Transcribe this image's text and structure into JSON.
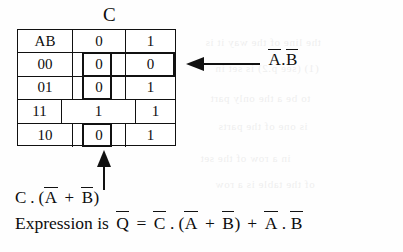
{
  "figure": {
    "type": "karnaugh-map-truth-table",
    "column_variable_label": "C",
    "row_variable_label": "AB"
  },
  "table": {
    "corner_header": "AB",
    "col_headers": [
      "0",
      "1"
    ],
    "rows": [
      {
        "ab": "00",
        "c0": "0",
        "c1": "0",
        "merged": false
      },
      {
        "ab": "01",
        "c0": "0",
        "c1": "1",
        "merged": false
      },
      {
        "ab": "11",
        "c0": "1",
        "c1": "1",
        "merged": true,
        "merged_value": "1"
      },
      {
        "ab": "10",
        "c0": "0",
        "c1": "1",
        "merged": false
      }
    ]
  },
  "groups": [
    {
      "name": "group-a-bar-b-bar",
      "label": "A.B (both complemented) row 00 across C=0 and C=1"
    },
    {
      "name": "group-c-bar-term",
      "label": "C=0 column cells for rows 00 and 01"
    },
    {
      "name": "group-c0-row10",
      "label": "C=0 cell for row 10"
    }
  ],
  "annotations": {
    "right_label": {
      "a_bar": "A",
      "dot": ".",
      "b_bar": "B",
      "plain": "A.B"
    },
    "bottom_label": {
      "c": "C",
      "dot": ".",
      "open": "(",
      "a_bar": "A",
      "plus": "+",
      "b_bar": "B",
      "close": ")",
      "plain": "C . (A + B)"
    }
  },
  "expression": {
    "prefix": "Expression is",
    "q_bar": "Q",
    "equals": "=",
    "c_bar": "C",
    "dot1": ".",
    "open": "(",
    "a_bar1": "A",
    "plus1": "+",
    "b_bar1": "B",
    "close": ")",
    "plus2": "+",
    "a_bar2": "A",
    "dot2": ".",
    "b_bar2": "B",
    "plain": "Expression is Q = C . (A + B) + A . B"
  },
  "colors": {
    "ink": "#111111",
    "paper": "#fefefe"
  },
  "ghost_text": [
    "the line of the way it is",
    "(1) (see p.2) is set in",
    "to be a the only part",
    "is one of the parts",
    "in a row of the set",
    "of the table is a row"
  ]
}
